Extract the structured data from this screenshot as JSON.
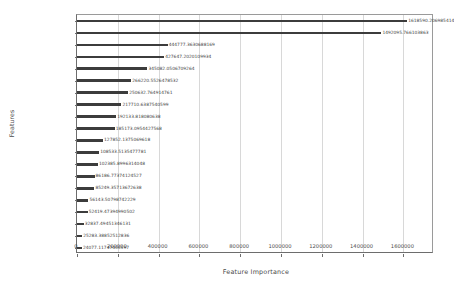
{
  "chart_data": {
    "type": "bar",
    "orientation": "horizontal",
    "title": "",
    "xlabel": "Feature Importance",
    "ylabel": "Features",
    "xlim": [
      0,
      1750000
    ],
    "grid": true,
    "legend": null,
    "xticks": [
      0,
      200000,
      400000,
      600000,
      800000,
      1000000,
      1200000,
      1400000,
      1600000
    ],
    "xticklabels": [
      "0",
      "200000",
      "400000",
      "600000",
      "800000",
      "1000000",
      "1200000",
      "1400000",
      "1600000"
    ],
    "categories": [
      "mean_7_day_nopromo",
      "mean_14_day_nopromo",
      "mean_30_day_nopromo",
      "median_30_dow0_2017",
      "mean_10_day_nopromo",
      "mean_5_day_nopromo",
      "promo_0",
      "mean_1_dow0_2017",
      "day_1_has",
      "mean_21_day_nopromo",
      "median_30_day_nopromo",
      "count0_14_2017",
      "count0_30_2017",
      "promo_bef_0",
      "count0_7_2017",
      "mean_3_day_nopromo",
      "count0_21_2017",
      "median_15_dow0_2017",
      "mean_60_day_nopromo",
      "median_20_dow0_2017"
    ],
    "values": [
      1618590.206985414,
      1492095.766103863,
      444777.3630688169,
      427647.2020109934,
      345082.0506709264,
      266220.5526478532,
      250632.764914761,
      217710.6387540599,
      192133.818080638,
      185173.0954427568,
      127852.1375069618,
      108533.5135477781,
      102385.8996314048,
      86186.77374124527,
      85249.35713672638,
      56143.50798742229,
      52419.47394990502,
      32837.49451346131,
      25283.38852512836,
      24077.11747455597
    ],
    "valuelabels": [
      "1618590.206985414",
      "1492095.766103863",
      "444777.3630688169",
      "427647.2020109934",
      "345082.0506709264",
      "266220.5526478532",
      "250632.764914761",
      "217710.6387540599",
      "192133.818080638",
      "185173.0954427568",
      "127852.1375069618",
      "108533.5135477781",
      "102385.8996314048",
      "86186.77374124527",
      "85249.35713672638",
      "56143.50798742229",
      "52419.47394990502",
      "32837.49451346131",
      "25283.38852512836",
      "24077.11747455597"
    ],
    "colors": {
      "bar": "#3c3c3c",
      "grid": "#d8d8d8",
      "axis": "#6d6d6d",
      "text": "#4a4a4a",
      "background": "#ffffff"
    }
  }
}
